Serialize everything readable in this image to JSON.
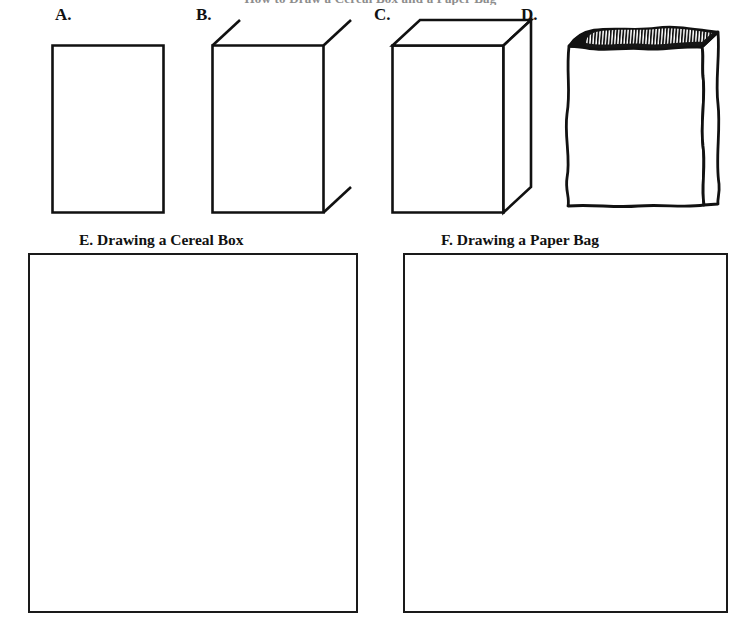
{
  "page": {
    "width": 741,
    "height": 632,
    "background_color": "#ffffff",
    "ink_color": "#000000",
    "clipped_header_text": "How to Draw a Cereal Box and a Paper Bag"
  },
  "steps": [
    {
      "id": "a",
      "letter": "A.",
      "figure_name": "flat-rectangle",
      "description": "A plain upright rectangle outline",
      "box": {
        "x": 52,
        "y": 45,
        "width": 111,
        "height": 167
      }
    },
    {
      "id": "b",
      "letter": "B.",
      "figure_name": "rectangle-with-guide-lines",
      "description": "Rectangle with three short diagonal guide strokes at corners",
      "box": {
        "x": 212,
        "y": 45,
        "width": 111,
        "height": 167
      }
    },
    {
      "id": "c",
      "letter": "C.",
      "figure_name": "three-dimensional-cereal-box",
      "description": "Completed three dimensional cereal box",
      "box": {
        "x": 392,
        "y": 45,
        "width": 111,
        "height": 167
      }
    },
    {
      "id": "d",
      "letter": "D.",
      "figure_name": "crinkled-paper-bag",
      "description": "Paper bag with wavy edges and a dark hatched crimped top",
      "box": {
        "x": 567,
        "y": 30,
        "width": 140,
        "height": 182
      }
    }
  ],
  "practice_sections": [
    {
      "id": "e",
      "caption": "E. Drawing a Cereal Box",
      "caption_x": 79,
      "caption_y": 232,
      "box": {
        "x": 28,
        "y": 253,
        "width": 330,
        "height": 360
      }
    },
    {
      "id": "f",
      "caption": "F. Drawing a Paper Bag",
      "caption_x": 441,
      "caption_y": 232,
      "box": {
        "x": 403,
        "y": 253,
        "width": 325,
        "height": 360
      }
    }
  ]
}
